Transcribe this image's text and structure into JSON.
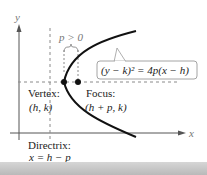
{
  "diagram": {
    "axes": {
      "x_label": "x",
      "y_label": "y"
    },
    "p_label": "p > 0",
    "equation": "(y − k)² = 4p(x − h)",
    "vertex": {
      "label": "Vertex:",
      "coords": "(h, k)"
    },
    "focus": {
      "label": "Focus:",
      "coords": "(h + p, k)"
    },
    "directrix": {
      "label": "Directrix:",
      "equation": "x = h − p"
    }
  },
  "colors": {
    "curve": "#111111",
    "axis": "#555555",
    "dashed": "#8a8a8a",
    "callout_border": "#9a9a9a",
    "band": "#c4c4c4"
  }
}
